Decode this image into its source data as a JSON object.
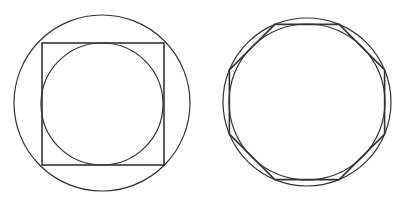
{
  "canvas": {
    "width": 398,
    "height": 205,
    "background": "#ffffff"
  },
  "stroke_color": "#333333",
  "figures": [
    {
      "name": "circle-square-circle",
      "outer_circle": {
        "cx": 102,
        "cy": 103,
        "r": 88
      },
      "square": {
        "x": 42,
        "y": 43,
        "size": 122
      },
      "inner_circle": {
        "cx": 102,
        "cy": 104,
        "r": 61
      }
    },
    {
      "name": "circle-octagon-circle",
      "outer_circle": {
        "cx": 307,
        "cy": 102,
        "r": 84
      },
      "octagon": {
        "cx": 307,
        "cy": 102,
        "r": 84,
        "sides": 8,
        "rotation_deg": 22.5
      },
      "inner_circle": {
        "cx": 307,
        "cy": 102,
        "r": 78
      }
    }
  ]
}
